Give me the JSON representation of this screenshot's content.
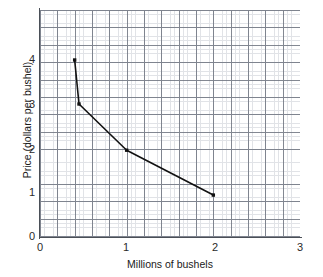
{
  "figure": {
    "background_color": "#ffffff",
    "ink_color": "#111111",
    "grid_minor_color": "#c9cdd4",
    "grid_major_color": "#6e7480",
    "axis_color": "#4a4f57"
  },
  "chart_data": {
    "type": "line",
    "title": "",
    "subtitle": "",
    "xlabel": "Millions of bushels",
    "ylabel": "Price (dollars per bushel)",
    "xlim": [
      0,
      3
    ],
    "ylim": [
      0,
      4.7
    ],
    "xticks": [
      0,
      1,
      2,
      3
    ],
    "xticklabels": [
      "0",
      "1",
      "2",
      "3"
    ],
    "yticks": [
      0,
      1,
      2,
      3,
      4
    ],
    "yticklabels": [
      "0",
      "1",
      "2",
      "3",
      "4"
    ],
    "grid": true,
    "grid_style": "graph-paper",
    "minor_grid": true,
    "legend": false,
    "legend_position": "none",
    "marker": "square",
    "marker_color": "#111111",
    "line_color": "#111111",
    "series": [
      {
        "name": "Demand curve",
        "x": [
          0.4,
          0.45,
          1.0,
          2.0
        ],
        "y": [
          4.0,
          3.0,
          1.95,
          0.93
        ],
        "points": [
          {
            "x": 0.4,
            "y": 4.0
          },
          {
            "x": 0.45,
            "y": 3.0
          },
          {
            "x": 1.0,
            "y": 1.95
          },
          {
            "x": 2.0,
            "y": 0.93
          }
        ]
      }
    ],
    "annotations": []
  },
  "axes": {
    "y": {
      "label": "Price (dollars per bushel)",
      "ticks": [
        {
          "value": 4,
          "label": "4"
        },
        {
          "value": 3,
          "label": "3"
        },
        {
          "value": 2,
          "label": "2"
        },
        {
          "value": 1,
          "label": "1"
        },
        {
          "value": 0,
          "label": "0"
        }
      ]
    },
    "x": {
      "label": "Millions of bushels",
      "ticks": [
        {
          "value": 0,
          "label": "0"
        },
        {
          "value": 1,
          "label": "1"
        },
        {
          "value": 2,
          "label": "2"
        },
        {
          "value": 3,
          "label": "3"
        }
      ]
    }
  }
}
